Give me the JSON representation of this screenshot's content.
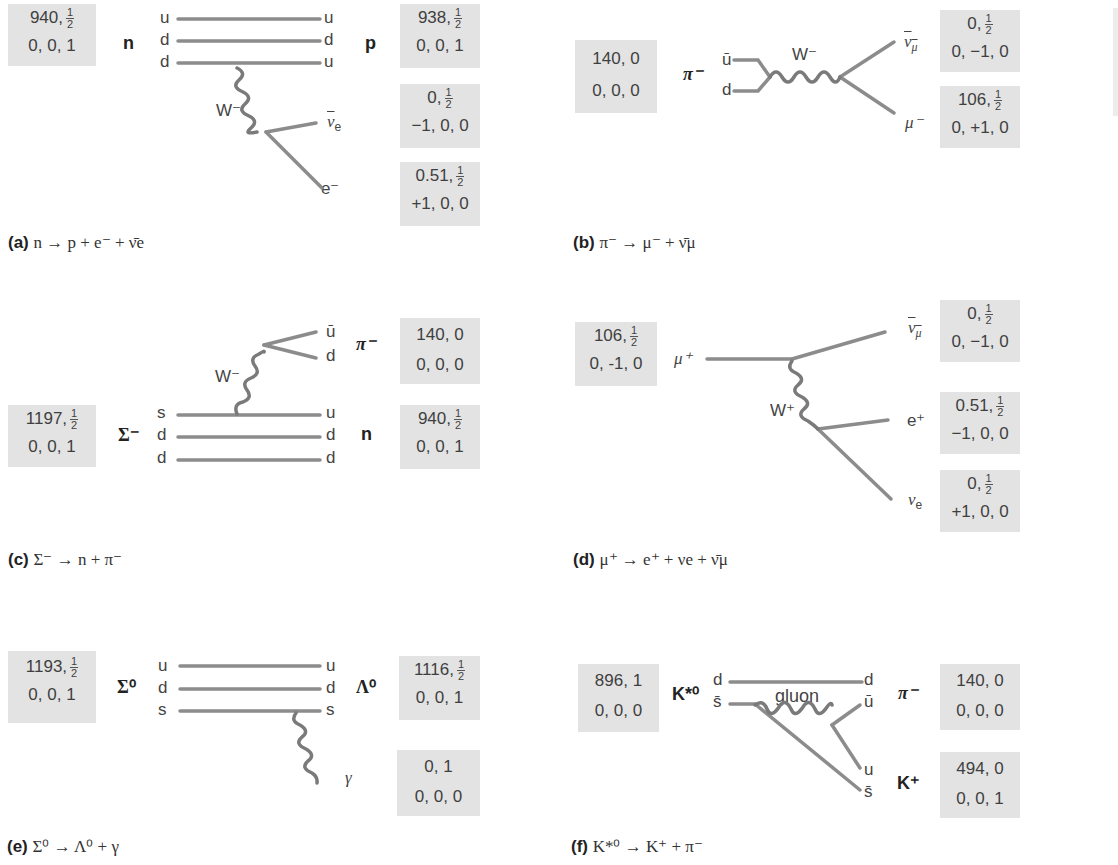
{
  "figure": {
    "panels": [
      {
        "id": "a",
        "caption_label": "(a)",
        "caption_equation": "n → p + e⁻ + ν̄e",
        "initial": {
          "name": "n",
          "box_row1": "940,",
          "box_frac": [
            "1",
            "2"
          ],
          "box_row2": "0, 0, 1",
          "quarks": [
            "u",
            "d",
            "d"
          ]
        },
        "final": [
          {
            "name": "p",
            "box_row1": "938,",
            "box_frac": [
              "1",
              "2"
            ],
            "box_row2": "0, 0, 1",
            "quarks": [
              "u",
              "d",
              "u"
            ]
          },
          {
            "name": "ν̄e",
            "box_row1": "0,",
            "box_frac": [
              "1",
              "2"
            ],
            "box_row2": "−1, 0, 0"
          },
          {
            "name": "e⁻",
            "box_row1": "0.51,",
            "box_frac": [
              "1",
              "2"
            ],
            "box_row2": "+1, 0, 0"
          }
        ],
        "boson": "W⁻"
      },
      {
        "id": "b",
        "caption_label": "(b)",
        "caption_equation": "π⁻ → μ⁻ + ν̄μ",
        "initial": {
          "name": "π⁻",
          "box_row1": "140, 0",
          "box_row2": "0, 0, 0",
          "quarks": [
            "ū",
            "d"
          ]
        },
        "final": [
          {
            "name": "ν̄μ",
            "box_row1": "0,",
            "box_frac": [
              "1",
              "2"
            ],
            "box_row2": "0, −1, 0"
          },
          {
            "name": "μ⁻",
            "box_row1": "106,",
            "box_frac": [
              "1",
              "2"
            ],
            "box_row2": "0, +1, 0"
          }
        ],
        "boson": "W⁻"
      },
      {
        "id": "c",
        "caption_label": "(c)",
        "caption_equation": "Σ⁻ → n + π⁻",
        "initial": {
          "name": "Σ⁻",
          "box_row1": "1197,",
          "box_frac": [
            "1",
            "2"
          ],
          "box_row2": "0, 0, 1",
          "quarks": [
            "s",
            "d",
            "d"
          ]
        },
        "final": [
          {
            "name": "π⁻",
            "box_row1": "140, 0",
            "box_row2": "0, 0, 0",
            "quarks": [
              "ū",
              "d"
            ]
          },
          {
            "name": "n",
            "box_row1": "940,",
            "box_frac": [
              "1",
              "2"
            ],
            "box_row2": "0, 0, 1",
            "quarks": [
              "u",
              "d",
              "d"
            ]
          }
        ],
        "boson": "W⁻"
      },
      {
        "id": "d",
        "caption_label": "(d)",
        "caption_equation": "μ⁺ →  e⁺ + νe + ν̄μ",
        "initial": {
          "name": "μ⁺",
          "box_row1": "106,",
          "box_frac": [
            "1",
            "2"
          ],
          "box_row2": "0, -1, 0"
        },
        "final": [
          {
            "name": "ν̄μ",
            "box_row1": "0,",
            "box_frac": [
              "1",
              "2"
            ],
            "box_row2": "0, −1, 0"
          },
          {
            "name": "e⁺",
            "box_row1": "0.51,",
            "box_frac": [
              "1",
              "2"
            ],
            "box_row2": "−1, 0, 0"
          },
          {
            "name": "νe",
            "box_row1": "0,",
            "box_frac": [
              "1",
              "2"
            ],
            "box_row2": "+1, 0, 0"
          }
        ],
        "boson": "W⁺"
      },
      {
        "id": "e",
        "caption_label": "(e)",
        "caption_equation": "Σ⁰ → Λ⁰ +  γ",
        "initial": {
          "name": "Σ⁰",
          "box_row1": "1193,",
          "box_frac": [
            "1",
            "2"
          ],
          "box_row2": "0, 0, 1",
          "quarks": [
            "u",
            "d",
            "s"
          ]
        },
        "final": [
          {
            "name": "Λ⁰",
            "box_row1": "1116,",
            "box_frac": [
              "1",
              "2"
            ],
            "box_row2": "0, 0, 1",
            "quarks": [
              "u",
              "d",
              "s"
            ]
          },
          {
            "name": "γ",
            "box_row1": "0, 1",
            "box_row2": "0, 0, 0"
          }
        ],
        "boson": "γ"
      },
      {
        "id": "f",
        "caption_label": "(f)",
        "caption_equation": "K*⁰ → K⁺ +  π⁻",
        "initial": {
          "name": "K*⁰",
          "box_row1": "896, 1",
          "box_row2": "0, 0, 0",
          "quarks": [
            "d",
            "s̄"
          ]
        },
        "final": [
          {
            "name": "π⁻",
            "box_row1": "140, 0",
            "box_row2": "0, 0, 0",
            "quarks": [
              "d",
              "ū"
            ]
          },
          {
            "name": "K⁺",
            "box_row1": "494, 0",
            "box_row2": "0, 0, 1",
            "quarks": [
              "u",
              "s̄"
            ]
          }
        ],
        "boson": "gluon"
      }
    ],
    "colors": {
      "line": "#8c8c8c",
      "box": "#e3e3e3",
      "text": "#3f3f3f"
    }
  }
}
